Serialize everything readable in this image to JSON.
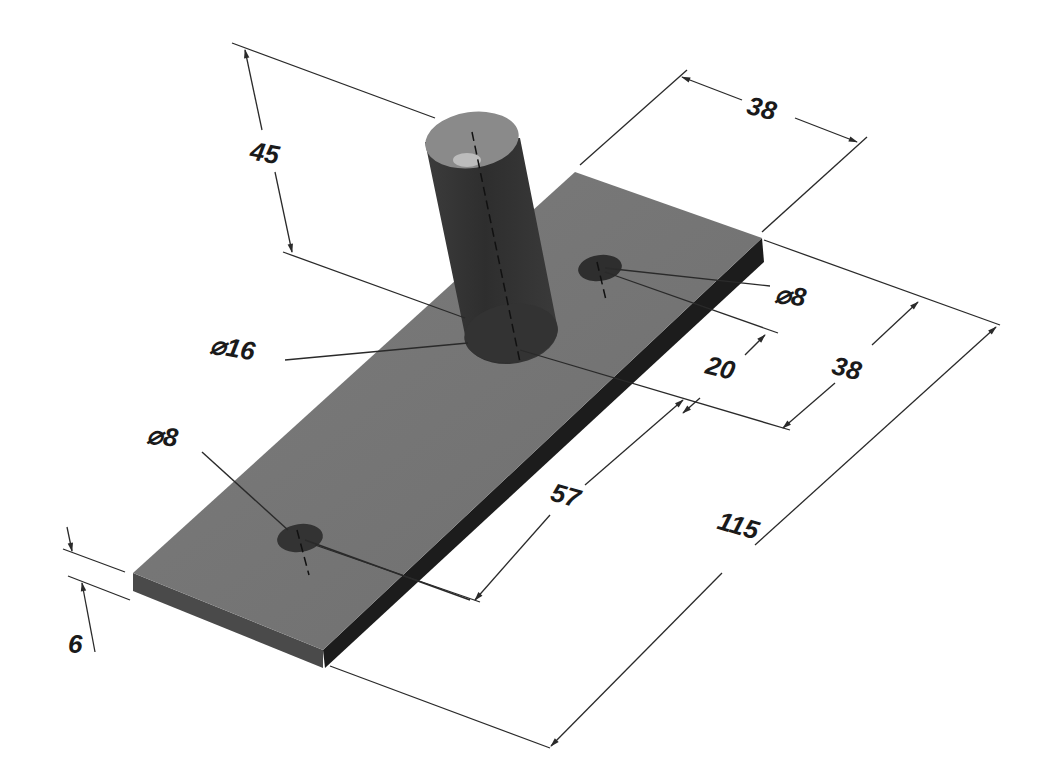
{
  "drawing": {
    "type": "isometric-dimensioned-part",
    "part": {
      "base_plate": {
        "length": "115",
        "width": "38",
        "thickness": "6"
      },
      "pin": {
        "diameter": "Ø16",
        "height": "45"
      },
      "holes": [
        {
          "diameter": "Ø8",
          "position": "back"
        },
        {
          "diameter": "Ø8",
          "position": "front"
        }
      ]
    },
    "colors": {
      "plate_top": "#7a7a7a",
      "plate_side_right": "#1e1e1e",
      "plate_side_front": "#4a4a4a",
      "cylinder_body": "#363636",
      "cylinder_top": "#8a8a8a",
      "hole": "#2e2e2e",
      "lines": "#2a2a2a"
    }
  },
  "dimensions": {
    "pin_height": "45",
    "plate_width": "38",
    "back_hole_diameter": "⌀8",
    "pin_diameter": "⌀16",
    "back_hole_offset": "20",
    "pin_offset": "38",
    "front_hole_diameter": "⌀8",
    "hole_spacing": "57",
    "plate_length": "115",
    "plate_thickness": "6"
  }
}
